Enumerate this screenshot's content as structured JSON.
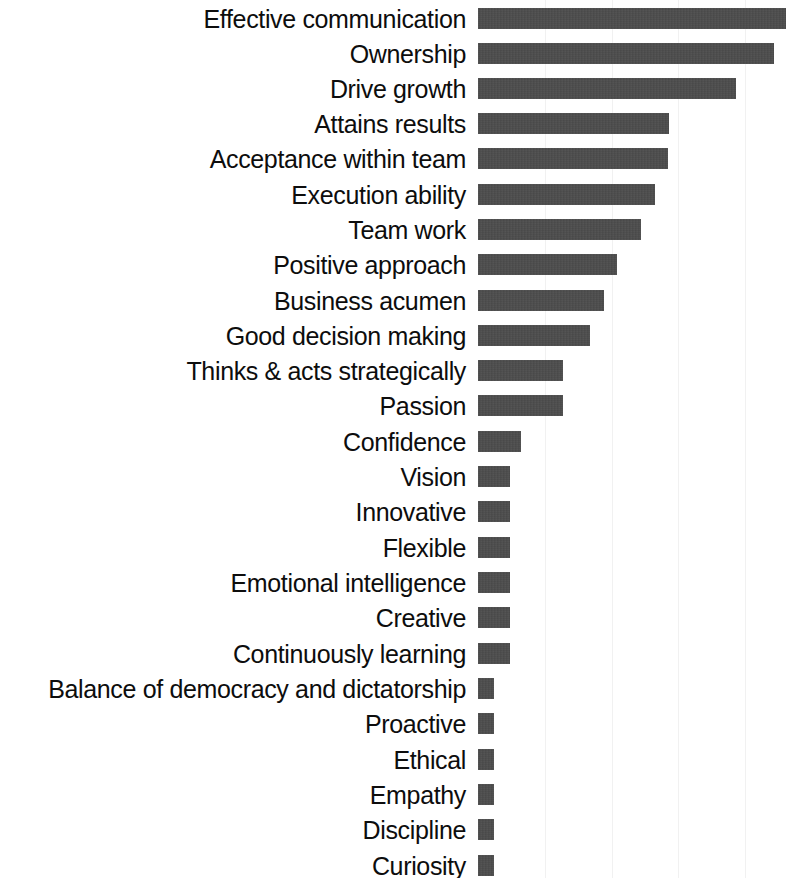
{
  "chart_data": {
    "type": "bar",
    "orientation": "horizontal",
    "title": "",
    "subtitle": "",
    "xlabel": "",
    "ylabel": "",
    "grid": "vertical gridlines only, no axis labels or tick labels shown",
    "legend": "none",
    "bar_color": "#4d4d4d",
    "background_color": "#ffffff",
    "text_color": "#0d0d0d",
    "gridline_color": "#f1f1f1",
    "axis_origin_px": 478,
    "gridline_positions_px": [
      545,
      612,
      678,
      745
    ],
    "xlim": [
      0,
      310
    ],
    "categories": [
      "Effective communication",
      "Ownership",
      "Drive growth",
      "Attains results",
      "Acceptance within team",
      "Execution ability",
      "Team work",
      "Positive approach",
      "Business acumen",
      "Good decision making",
      "Thinks & acts strategically",
      "Passion",
      "Confidence",
      "Vision",
      "Innovative",
      "Flexible",
      "Emotional intelligence",
      "Creative",
      "Continuously learning",
      "Balance of democracy and dictatorship",
      "Proactive",
      "Ethical",
      "Empathy",
      "Discipline",
      "Curiosity"
    ],
    "values": [
      308,
      296,
      258,
      191,
      190,
      177,
      163,
      139,
      126,
      112,
      85,
      85,
      43,
      32,
      32,
      32,
      32,
      32,
      32,
      16,
      16,
      16,
      16,
      16,
      16
    ]
  },
  "rows": [
    {
      "label": "Effective communication",
      "value": 308,
      "top": 8
    },
    {
      "label": "Ownership",
      "value": 296,
      "top": 43
    },
    {
      "label": "Drive growth",
      "value": 258,
      "top": 78
    },
    {
      "label": "Attains results",
      "value": 191,
      "top": 113
    },
    {
      "label": "Acceptance within team",
      "value": 190,
      "top": 148
    },
    {
      "label": "Execution ability",
      "value": 177,
      "top": 184
    },
    {
      "label": "Team work",
      "value": 163,
      "top": 219
    },
    {
      "label": "Positive approach",
      "value": 139,
      "top": 254
    },
    {
      "label": "Business acumen",
      "value": 126,
      "top": 290
    },
    {
      "label": "Good decision making",
      "value": 112,
      "top": 325
    },
    {
      "label": "Thinks & acts strategically",
      "value": 85,
      "top": 360
    },
    {
      "label": "Passion",
      "value": 85,
      "top": 395
    },
    {
      "label": "Confidence",
      "value": 43,
      "top": 431
    },
    {
      "label": "Vision",
      "value": 32,
      "top": 466
    },
    {
      "label": "Innovative",
      "value": 32,
      "top": 501
    },
    {
      "label": "Flexible",
      "value": 32,
      "top": 537
    },
    {
      "label": "Emotional intelligence",
      "value": 32,
      "top": 572
    },
    {
      "label": "Creative",
      "value": 32,
      "top": 607
    },
    {
      "label": "Continuously learning",
      "value": 32,
      "top": 643
    },
    {
      "label": "Balance of democracy and dictatorship",
      "value": 16,
      "top": 678
    },
    {
      "label": "Proactive",
      "value": 16,
      "top": 713
    },
    {
      "label": "Ethical",
      "value": 16,
      "top": 749
    },
    {
      "label": "Empathy",
      "value": 16,
      "top": 784
    },
    {
      "label": "Discipline",
      "value": 16,
      "top": 819
    },
    {
      "label": "Curiosity",
      "value": 16,
      "top": 855
    }
  ],
  "gridlines": [
    545,
    612,
    678,
    745
  ]
}
